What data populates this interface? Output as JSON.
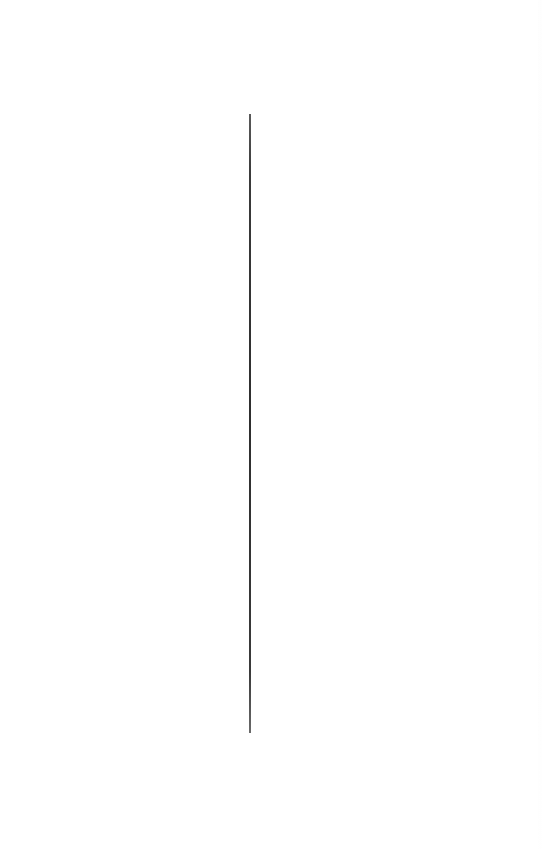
{
  "canvas": {
    "background_color": "#ffffff",
    "width": 542,
    "height": 849
  },
  "vertical_rule": {
    "color": "#2e2e2e",
    "x": 249,
    "y_start": 114,
    "y_end": 733
  }
}
